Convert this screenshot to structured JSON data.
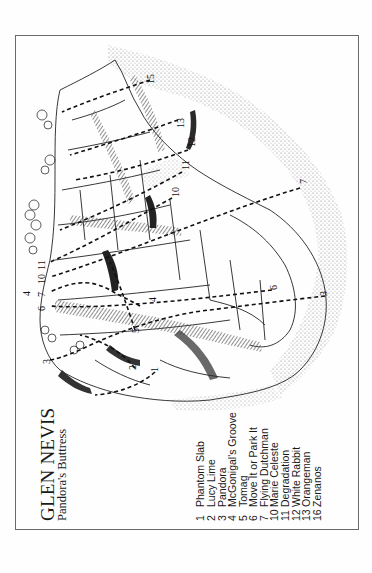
{
  "title": "GLEN NEVIS",
  "subtitle": "Pandora's Buttress",
  "orientation": "rotated 90deg counterclockwise",
  "colors": {
    "ink": "#1a1a1a",
    "frame": "#6a6a6a",
    "paper": "#fefefe",
    "shade": "#555555",
    "stipple": "#8a8a8a"
  },
  "legend": [
    {
      "num": "1",
      "name": "Phantom Slab"
    },
    {
      "num": "2",
      "name": "Lucy Lime"
    },
    {
      "num": "3",
      "name": "Pandora"
    },
    {
      "num": "4",
      "name": "McGonigal's Groove"
    },
    {
      "num": "5",
      "name": "Tomag"
    },
    {
      "num": "6",
      "name": "Move It or Park It"
    },
    {
      "num": "7",
      "name": "Flying Dutchman"
    },
    {
      "num": "10",
      "name": "Marie Celeste"
    },
    {
      "num": "11",
      "name": "Degradation"
    },
    {
      "num": "12",
      "name": "White Rabbit"
    },
    {
      "num": "13",
      "name": "Orangeman"
    },
    {
      "num": "16",
      "name": "Zenanos"
    }
  ],
  "route_labels": [
    {
      "text": "15",
      "x": 146,
      "y": 84
    },
    {
      "text": "13",
      "x": 176,
      "y": 128
    },
    {
      "text": "12",
      "x": 187,
      "y": 147
    },
    {
      "text": "11",
      "x": 181,
      "y": 170
    },
    {
      "text": "10",
      "x": 171,
      "y": 197
    },
    {
      "text": "7",
      "x": 299,
      "y": 184
    },
    {
      "text": "11",
      "x": 37,
      "y": 270
    },
    {
      "text": "10",
      "x": 37,
      "y": 284
    },
    {
      "text": "7",
      "x": 37,
      "y": 297
    },
    {
      "text": "4",
      "x": 22,
      "y": 296
    },
    {
      "text": "6",
      "x": 37,
      "y": 311
    },
    {
      "text": "6",
      "x": 269,
      "y": 290
    },
    {
      "text": "3",
      "x": 319,
      "y": 296
    },
    {
      "text": "3",
      "x": 42,
      "y": 364
    },
    {
      "text": "5",
      "x": 131,
      "y": 333
    },
    {
      "text": "4",
      "x": 148,
      "y": 302
    },
    {
      "text": "2",
      "x": 128,
      "y": 370
    },
    {
      "text": "1",
      "x": 150,
      "y": 372
    }
  ]
}
